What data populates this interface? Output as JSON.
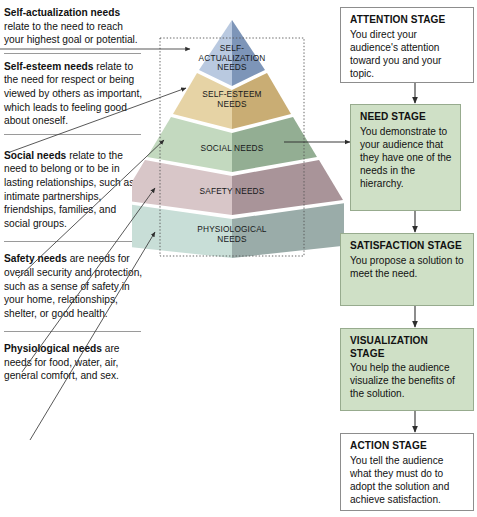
{
  "diagram": {
    "colors": {
      "stage_tint": "#cfe0c6",
      "stage_border": "#8d8d8d",
      "apex_light": "#b9c9e0",
      "apex_dark": "#7d95b8",
      "esteem_light": "#e6d3a5",
      "esteem_dark": "#c9ad74",
      "social_light": "#c3d9bf",
      "social_dark": "#93ae93",
      "safety_light": "#d8c6c8",
      "safety_dark": "#a99499",
      "physio_light": "#c8ded7",
      "physio_dark": "#9aaca9",
      "rule": "#9a9a9a",
      "arrow": "#3a3a3a"
    }
  },
  "needs": [
    {
      "id": "self-actualization",
      "term": "Self-actualization needs",
      "text": " relate to the need to reach your highest goal or potential."
    },
    {
      "id": "self-esteem",
      "term": "Self-esteem needs",
      "text": " relate to the need for respect or being viewed by others as important, which leads to feeling good about oneself."
    },
    {
      "id": "social",
      "term": "Social needs",
      "text": " relate to the need to belong or to be in lasting relationships, such as intimate partnerships, friendships, families, and social groups."
    },
    {
      "id": "safety",
      "term": "Safety needs",
      "text": " are needs for overall security and protection, such as a sense of safety in your home, relationships, shelter, or good health."
    },
    {
      "id": "physiological",
      "term": "Physiological needs",
      "text": " are needs for food, water, air, general comfort, and sex."
    }
  ],
  "pyramid": {
    "levels": [
      {
        "id": "self-actualization",
        "label": "SELF-\nACTUALIZATION\nNEEDS"
      },
      {
        "id": "self-esteem",
        "label": "SELF-ESTEEM\nNEEDS"
      },
      {
        "id": "social",
        "label": "SOCIAL NEEDS"
      },
      {
        "id": "safety",
        "label": "SAFETY NEEDS"
      },
      {
        "id": "physiological",
        "label": "PHYSIOLOGICAL\nNEEDS"
      }
    ]
  },
  "stages": [
    {
      "id": "attention",
      "title": "ATTENTION STAGE",
      "body": "You direct your audience's attention toward you and your topic.",
      "style": "plain"
    },
    {
      "id": "need",
      "title": "NEED STAGE",
      "body": "You demonstrate to your audience that they have one of the needs in the hierarchy.",
      "style": "tinted"
    },
    {
      "id": "satisfaction",
      "title": "SATISFACTION STAGE",
      "body": "You propose a solution to meet the need.",
      "style": "tinted"
    },
    {
      "id": "visualization",
      "title": "VISUALIZATION STAGE",
      "body": "You help the audience visualize the benefits of the solution.",
      "style": "tinted"
    },
    {
      "id": "action",
      "title": "ACTION STAGE",
      "body": "You tell the audience what they must do to adopt the solution and achieve satisfaction.",
      "style": "plain"
    }
  ]
}
